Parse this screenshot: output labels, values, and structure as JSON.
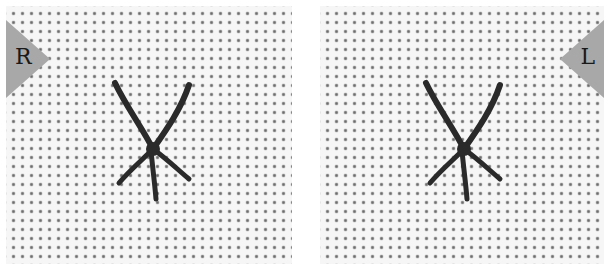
{
  "panels": [
    {
      "side": "right",
      "label": "R",
      "stitch": "x-stitch-with-tail"
    },
    {
      "side": "left",
      "label": "L",
      "stitch": "x-stitch-with-tail"
    }
  ],
  "colors": {
    "fabric": "#f6f6f6",
    "hole": "#6e6e6e",
    "tab": "#a8a8a8",
    "thread": "#2a2a2a"
  }
}
